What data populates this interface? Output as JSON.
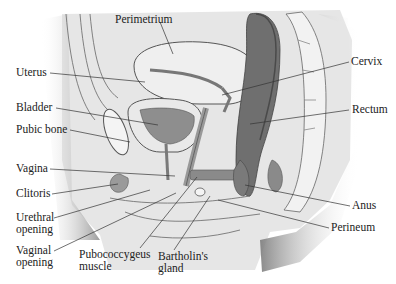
{
  "diagram": {
    "type": "anatomical-cross-section",
    "colors": {
      "background": "#ffffff",
      "shadow": "#7a7a7a",
      "tissue_light": "#ededed",
      "tissue_mid": "#c4c4c4",
      "tissue_dark": "#6f6f6f",
      "outline": "#555555",
      "leader": "#333333",
      "text": "#222222"
    },
    "labels": [
      {
        "id": "perimetrium",
        "text": "Perimetrium",
        "x": 115,
        "y": 13
      },
      {
        "id": "uterus",
        "text": "Uterus",
        "x": 16,
        "y": 66
      },
      {
        "id": "cervix",
        "text": "Cervix",
        "x": 351,
        "y": 55
      },
      {
        "id": "bladder",
        "text": "Bladder",
        "x": 16,
        "y": 101
      },
      {
        "id": "rectum",
        "text": "Rectum",
        "x": 352,
        "y": 103
      },
      {
        "id": "pubic-bone",
        "text": "Pubic bone",
        "x": 16,
        "y": 123
      },
      {
        "id": "vagina",
        "text": "Vagina",
        "x": 16,
        "y": 162
      },
      {
        "id": "clitoris",
        "text": "Clitoris",
        "x": 16,
        "y": 187
      },
      {
        "id": "anus",
        "text": "Anus",
        "x": 352,
        "y": 199
      },
      {
        "id": "urethral-opening",
        "text": "Urethral\nopening",
        "x": 16,
        "y": 211
      },
      {
        "id": "perineum",
        "text": "Perineum",
        "x": 331,
        "y": 221
      },
      {
        "id": "vaginal-opening",
        "text": "Vaginal\nopening",
        "x": 16,
        "y": 244
      },
      {
        "id": "pubococcygeus-muscle",
        "text": "Pubococcygeus\nmuscle",
        "x": 79,
        "y": 248
      },
      {
        "id": "bartholins-gland",
        "text": "Bartholin's\ngland",
        "x": 158,
        "y": 250
      }
    ],
    "leader_lines": [
      {
        "id": "perimetrium",
        "x1": 160,
        "y1": 22,
        "x2": 173,
        "y2": 54
      },
      {
        "id": "uterus",
        "x1": 50,
        "y1": 73,
        "x2": 145,
        "y2": 82
      },
      {
        "id": "cervix",
        "x1": 349,
        "y1": 62,
        "x2": 222,
        "y2": 95
      },
      {
        "id": "bladder",
        "x1": 56,
        "y1": 108,
        "x2": 158,
        "y2": 125
      },
      {
        "id": "rectum",
        "x1": 349,
        "y1": 110,
        "x2": 250,
        "y2": 124
      },
      {
        "id": "pubic-bone",
        "x1": 70,
        "y1": 130,
        "x2": 130,
        "y2": 142
      },
      {
        "id": "vagina",
        "x1": 50,
        "y1": 169,
        "x2": 175,
        "y2": 176
      },
      {
        "id": "clitoris",
        "x1": 52,
        "y1": 194,
        "x2": 118,
        "y2": 184
      },
      {
        "id": "anus",
        "x1": 350,
        "y1": 206,
        "x2": 245,
        "y2": 185
      },
      {
        "id": "urethral-opening",
        "x1": 54,
        "y1": 218,
        "x2": 150,
        "y2": 190
      },
      {
        "id": "perineum",
        "x1": 329,
        "y1": 228,
        "x2": 218,
        "y2": 200
      },
      {
        "id": "vaginal-opening",
        "x1": 54,
        "y1": 251,
        "x2": 176,
        "y2": 193
      },
      {
        "id": "pubococcygeus-muscle",
        "x1": 140,
        "y1": 248,
        "x2": 197,
        "y2": 177
      },
      {
        "id": "bartholins-gland",
        "x1": 174,
        "y1": 250,
        "x2": 210,
        "y2": 196
      }
    ]
  }
}
